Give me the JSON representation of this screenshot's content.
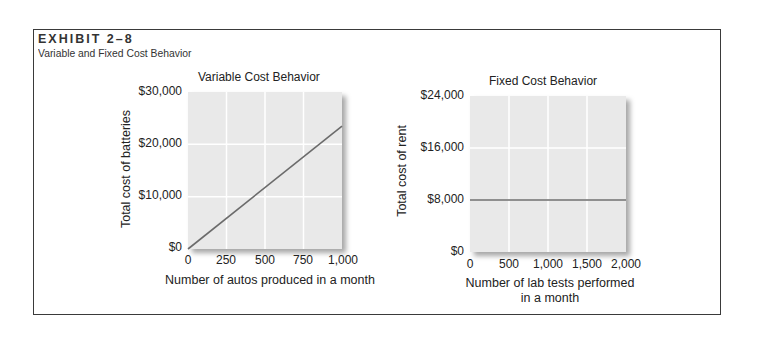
{
  "exhibit": {
    "label": "EXHIBIT 2–8",
    "subtitle": "Variable and Fixed Cost Behavior"
  },
  "colors": {
    "plot_bg": "#e9e9e9",
    "grid": "#ffffff",
    "line": "#6b6b6b",
    "frame": "#3a3a3a"
  },
  "chart_data": [
    {
      "type": "line",
      "title": "Variable Cost Behavior",
      "xlabel": "Number of autos produced in a month",
      "ylabel": "Total cost of batteries",
      "x": [
        0,
        1000
      ],
      "series": [
        {
          "name": "Total cost of batteries",
          "values": [
            0,
            23500
          ]
        }
      ],
      "xlim": [
        0,
        1000
      ],
      "ylim": [
        0,
        30000
      ],
      "xticks": [
        "0",
        "250",
        "500",
        "750",
        "1,000"
      ],
      "yticks": [
        "$0",
        "$10,000",
        "$20,000",
        "$30,000"
      ],
      "grid": true,
      "legend": "none"
    },
    {
      "type": "line",
      "title": "Fixed Cost Behavior",
      "xlabel": "Number of lab tests performed in a month",
      "xlabel_lines": [
        "Number of lab tests performed",
        "in a month"
      ],
      "ylabel": "Total cost of rent",
      "x": [
        0,
        2000
      ],
      "series": [
        {
          "name": "Total cost of rent",
          "values": [
            8000,
            8000
          ]
        }
      ],
      "xlim": [
        0,
        2000
      ],
      "ylim": [
        0,
        24000
      ],
      "xticks": [
        "0",
        "500",
        "1,000",
        "1,500",
        "2,000"
      ],
      "yticks": [
        "$0",
        "$8,000",
        "$16,000",
        "$24,000"
      ],
      "grid": true,
      "legend": "none"
    }
  ]
}
